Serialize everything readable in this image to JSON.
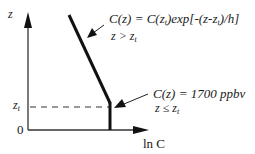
{
  "diagram": {
    "type": "vertical concentration profile",
    "axes": {
      "y_label": "z",
      "x_label": "ln C",
      "origin_label": "0",
      "zt_label": "z",
      "zt_sub": "t"
    },
    "upper_annotation": {
      "formula_prefix": "C(z) = C(z",
      "formula_sub1": "t",
      "formula_mid": ")exp[-(z-z",
      "formula_sub2": "t",
      "formula_suffix": ")/h]",
      "condition_prefix": "z > z",
      "condition_sub": "t"
    },
    "lower_annotation": {
      "formula": "C(z) = 1700 ppbv",
      "condition_prefix": "z ≤ z",
      "condition_sub": "t"
    },
    "colors": {
      "line": "#1a1a1a",
      "axis": "#333333",
      "background": "#ffffff"
    }
  }
}
